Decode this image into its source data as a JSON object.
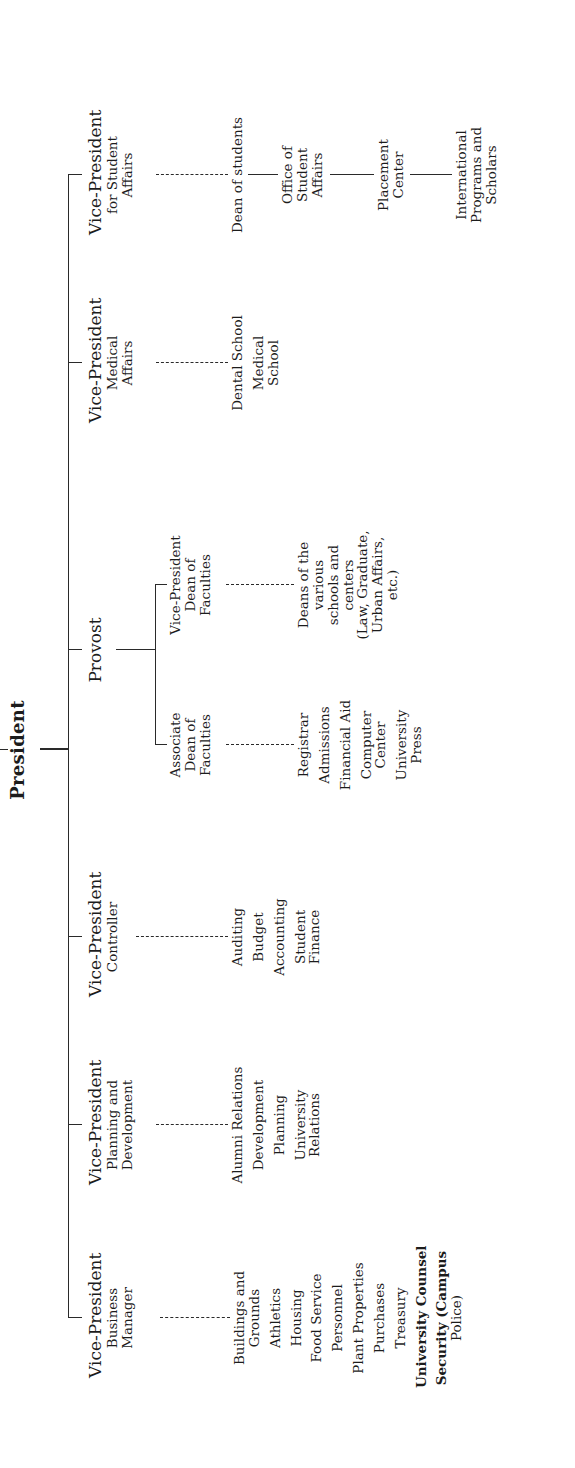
{
  "chart": {
    "type": "org-chart",
    "orientation": "rotated-90-ccw",
    "root": {
      "title": "President"
    },
    "level1": [
      {
        "title": "Vice-President",
        "subtitle_lines": [
          "Business",
          "Manager"
        ],
        "children": [
          [
            "Buildings and",
            "Grounds"
          ],
          [
            "Athletics"
          ],
          [
            "Housing"
          ],
          [
            "Food Service"
          ],
          [
            "Personnel"
          ],
          [
            "Plant Properties"
          ],
          [
            "Purchases"
          ],
          [
            "Treasury"
          ],
          [
            "University Counsel"
          ],
          [
            "Security (Campus",
            "Police)"
          ]
        ]
      },
      {
        "title": "Vice-President",
        "subtitle_lines": [
          "Planning and",
          "Development"
        ],
        "children": [
          [
            "Alumni Relations"
          ],
          [
            "Development"
          ],
          [
            "Planning"
          ],
          [
            "University",
            "Relations"
          ]
        ]
      },
      {
        "title": "Vice-President",
        "subtitle_lines": [
          "Controller"
        ],
        "children": [
          [
            "Auditing"
          ],
          [
            "Budget"
          ],
          [
            "Accounting"
          ],
          [
            "Student",
            "Finance"
          ]
        ]
      },
      {
        "title": "Provost",
        "subtitle_lines": [],
        "branches": [
          {
            "title_lines": [
              "Associate",
              "Dean of",
              "Faculties"
            ],
            "children": [
              [
                "Registrar"
              ],
              [
                "Admissions"
              ],
              [
                "Financial Aid"
              ],
              [
                "Computer",
                "Center"
              ],
              [
                "University",
                "Press"
              ]
            ]
          },
          {
            "title_lines": [
              "Vice-President",
              "Dean of",
              "Faculties"
            ],
            "children": [
              [
                "Deans of the",
                "various",
                "schools and",
                "centers",
                "(Law, Graduate,",
                "Urban Affairs,",
                "etc.)"
              ]
            ]
          }
        ]
      },
      {
        "title": "Vice-President",
        "subtitle_lines": [
          "Medical",
          "Affairs"
        ],
        "children": [
          [
            "Dental School"
          ],
          [
            "Medical",
            "School"
          ]
        ]
      },
      {
        "title": "Vice-President",
        "subtitle_lines": [
          "for Student",
          "Affairs"
        ],
        "children_chain": [
          [
            "Dean of students"
          ],
          [
            "Office of",
            "Student",
            "Affairs"
          ],
          [
            "Placement",
            "Center"
          ],
          [
            "International",
            "Programs and",
            "Scholars"
          ]
        ]
      }
    ]
  }
}
